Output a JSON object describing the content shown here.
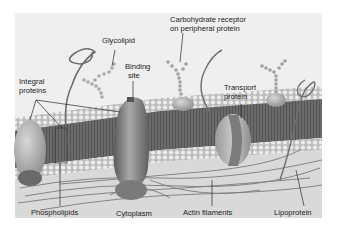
{
  "diagram": {
    "colors": {
      "background": "#efefef",
      "page": "#ffffff",
      "bilayer_core": "#6b6b6b",
      "head_beads": "#e6e6e6",
      "protein": "#8a8a8a",
      "label_text": "#222222"
    },
    "labels": {
      "glycolipid": "Glycolipid",
      "carbohydrate_receptor_line1": "Carbohydrate receptor",
      "carbohydrate_receptor_line2": "on peripheral protein",
      "binding_site_line1": "Binding",
      "binding_site_line2": "site",
      "integral_proteins_line1": "Integral",
      "integral_proteins_line2": "proteins",
      "transport_protein_line1": "Transport",
      "transport_protein_line2": "protein",
      "phospholipids": "Phospholipids",
      "cytoplasm": "Cytoplasm",
      "actin_filaments": "Actin filaments",
      "lipoprotein": "Lipoprotein"
    }
  }
}
